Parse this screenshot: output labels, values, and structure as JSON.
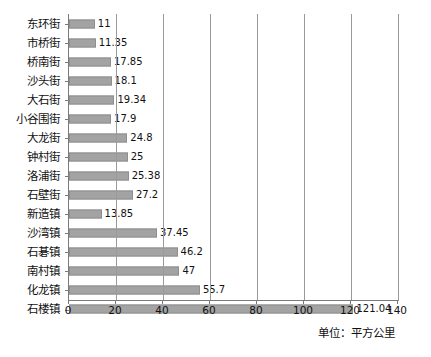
{
  "chart_data": {
    "type": "bar",
    "orientation": "horizontal",
    "title": "",
    "subtitle": "",
    "xlabel": "",
    "ylabel": "",
    "unit_caption": "单位：平方公里",
    "xlim": [
      0,
      140
    ],
    "xticks": [
      0,
      20,
      40,
      60,
      80,
      100,
      120,
      140
    ],
    "xtick_labels": [
      "0",
      "20",
      "40",
      "60",
      "80",
      "100",
      "120",
      "140"
    ],
    "grid": "vertical",
    "legend": "none",
    "bar_color": "#a3a3a3",
    "categories": [
      "东环街",
      "市桥街",
      "桥南街",
      "沙头街",
      "大石街",
      "小谷围街",
      "大龙街",
      "钟村街",
      "洛浦街",
      "石壁街",
      "新造镇",
      "沙湾镇",
      "石碁镇",
      "南村镇",
      "化龙镇",
      "石楼镇"
    ],
    "values": [
      11,
      11.35,
      17.85,
      18.1,
      19.34,
      17.9,
      24.8,
      25,
      25.38,
      27.2,
      13.85,
      37.45,
      46.2,
      47,
      55.7,
      121.04
    ],
    "value_labels": [
      "11",
      "11.35",
      "17.85",
      "18.1",
      "19.34",
      "17.9",
      "24.8",
      "25",
      "25.38",
      "27.2",
      "13.85",
      "37.45",
      "46.2",
      "47",
      "55.7",
      "121.04"
    ]
  }
}
